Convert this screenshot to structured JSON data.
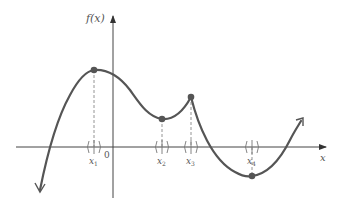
{
  "figure": {
    "y_axis_label": "f(x)",
    "x_axis_label": "x",
    "origin_label": "0",
    "colors": {
      "curve": "#555555",
      "axes": "#444444",
      "dashed": "#888888",
      "points": "#555555",
      "text": "#555555"
    }
  },
  "critical_points": [
    {
      "id": "x1",
      "label": "x",
      "subscript": "1",
      "type": "local maximum",
      "smooth": true
    },
    {
      "id": "x2",
      "label": "x",
      "subscript": "2",
      "type": "local minimum",
      "smooth": true
    },
    {
      "id": "x3",
      "label": "x",
      "subscript": "3",
      "type": "local maximum (corner/cusp)",
      "smooth": false
    },
    {
      "id": "x4",
      "label": "x",
      "subscript": "4",
      "type": "local minimum",
      "smooth": true
    }
  ]
}
